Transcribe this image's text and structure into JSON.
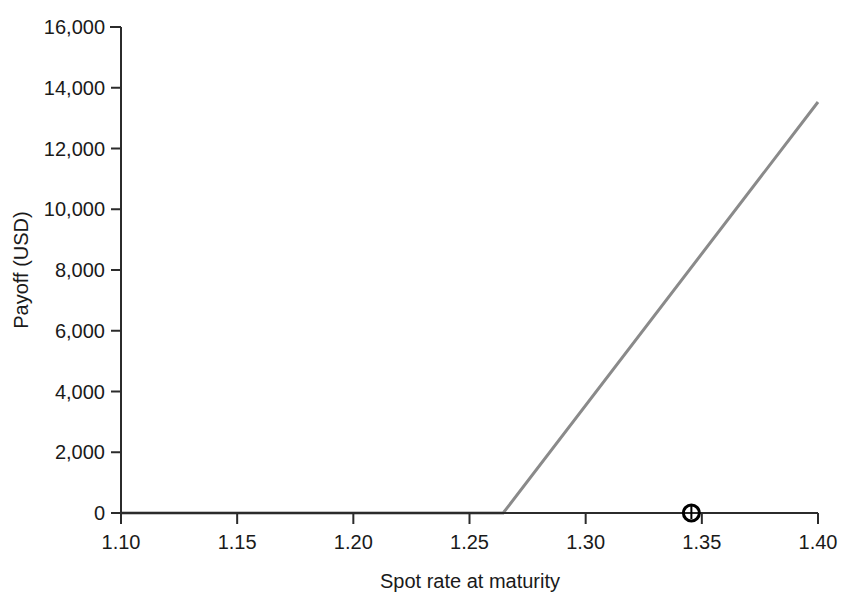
{
  "chart_data": {
    "type": "line",
    "title": "",
    "xlabel": "Spot rate at maturity",
    "ylabel": "Payoff (USD)",
    "xlim": [
      1.1,
      1.4
    ],
    "ylim": [
      0,
      16000
    ],
    "grid": false,
    "legend": null,
    "xticks": [
      1.1,
      1.15,
      1.2,
      1.25,
      1.3,
      1.35,
      1.4
    ],
    "xticklabels": [
      "1.10",
      "1.15",
      "1.20",
      "1.25",
      "1.30",
      "1.35",
      "1.40"
    ],
    "yticks": [
      0,
      2000,
      4000,
      6000,
      8000,
      10000,
      12000,
      14000,
      16000
    ],
    "yticklabels": [
      "0",
      "2,000",
      "4,000",
      "6,000",
      "8,000",
      "10,000",
      "12,000",
      "14,000",
      "16,000"
    ],
    "series": [
      {
        "name": "Call option payoff",
        "color": "#8a8a8a",
        "linewidth": 3,
        "x": [
          1.1,
          1.2645,
          1.4
        ],
        "values": [
          0,
          0,
          13530
        ]
      }
    ],
    "annotations": [
      {
        "name": "strike-marker",
        "marker": "circle-with-tick",
        "x": 1.3455,
        "y": 0,
        "color": "#000000",
        "radius_px": 8
      }
    ]
  },
  "axis": {
    "x_title": "Spot rate at maturity",
    "y_title": "Payoff (USD)"
  }
}
